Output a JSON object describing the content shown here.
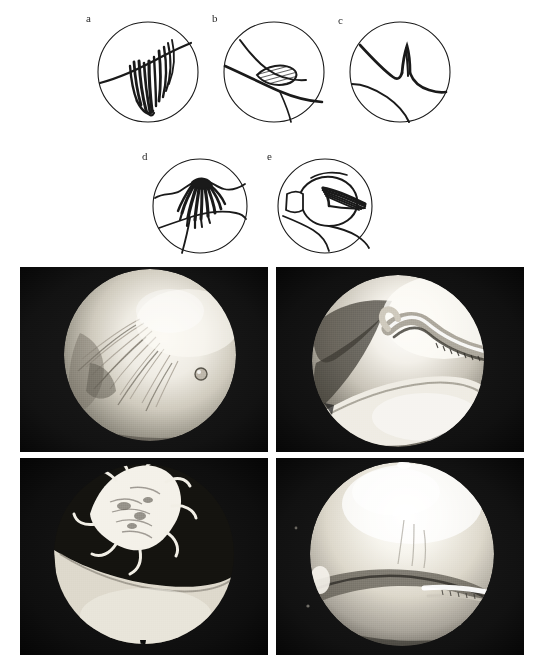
{
  "figure": {
    "background_color": "#ffffff",
    "ink_color": "#1a1a1a",
    "width": 547,
    "height": 664
  },
  "schematics": {
    "panels": [
      {
        "id": "a",
        "label": "a",
        "lesion_type": "fringed vertical flap tear",
        "cx": 148,
        "cy": 72,
        "r": 51,
        "label_x": 86,
        "label_y": 23
      },
      {
        "id": "b",
        "label": "b",
        "lesion_type": "hatched oval flap lesion",
        "cx": 274,
        "cy": 72,
        "r": 51,
        "label_x": 212,
        "label_y": 23
      },
      {
        "id": "c",
        "label": "c",
        "lesion_type": "vertical longitudinal tear",
        "cx": 400,
        "cy": 72,
        "r": 51,
        "label_x": 352,
        "label_y": 25
      },
      {
        "id": "d",
        "label": "d",
        "lesion_type": "frayed degenerative lesion",
        "cx": 200,
        "cy": 206,
        "r": 48,
        "label_x": 150,
        "label_y": 157
      },
      {
        "id": "e",
        "label": "e",
        "lesion_type": "displaced flap under condyle",
        "cx": 325,
        "cy": 206,
        "r": 48,
        "label_x": 288,
        "label_y": 157
      }
    ]
  },
  "photographs": {
    "columns": 2,
    "rows": 2,
    "cells": [
      {
        "id": "photo-top-left",
        "position": "top-left",
        "description": "arthroscopic view of fibrillated cartilage surface with shaggy fronds",
        "x": 0,
        "y": 0,
        "w": 248,
        "h": 185,
        "scope_cx": 130,
        "scope_cy": 88,
        "scope_r": 86,
        "surround_color": "#141414",
        "highlight_color": "#f2f0ea"
      },
      {
        "id": "photo-top-right",
        "position": "top-right",
        "description": "arthroscopic view with probe instrument against femoral condyle",
        "x": 256,
        "y": 0,
        "w": 248,
        "h": 185,
        "scope_cx": 122,
        "scope_cy": 94,
        "scope_r": 86,
        "surround_color": "#121212",
        "highlight_color": "#f5f3ee"
      },
      {
        "id": "photo-bottom-left",
        "position": "bottom-left",
        "description": "arthroscopic view of frayed shaggy meniscal lesion above condyle",
        "x": 0,
        "y": 191,
        "w": 248,
        "h": 197,
        "scope_cx": 124,
        "scope_cy": 96,
        "scope_r": 90,
        "surround_color": "#101010",
        "highlight_color": "#f6f4ef"
      },
      {
        "id": "photo-bottom-right",
        "position": "bottom-right",
        "description": "arthroscopic view of smooth femoral condyle with meniscal edge",
        "x": 256,
        "y": 191,
        "w": 248,
        "h": 197,
        "scope_cx": 126,
        "scope_cy": 96,
        "scope_r": 92,
        "surround_color": "#131313",
        "highlight_color": "#fbfaf6"
      }
    ]
  }
}
